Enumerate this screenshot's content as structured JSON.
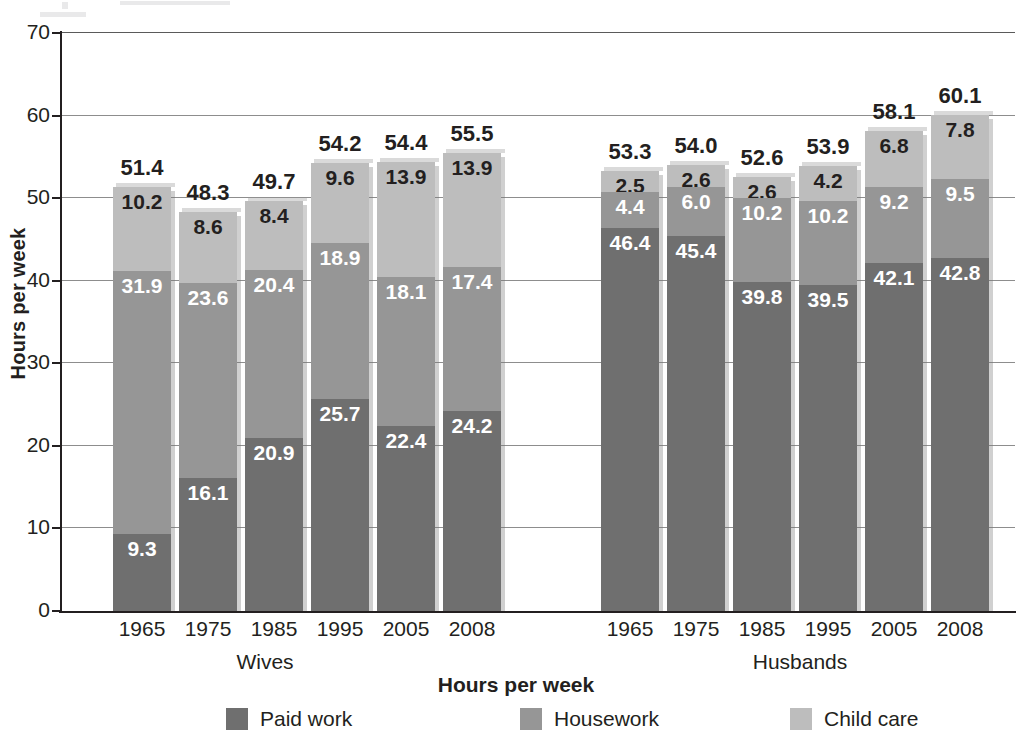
{
  "axis": {
    "y_label": "Hours per week",
    "y_ticks": [
      "70",
      "60",
      "50",
      "40",
      "30",
      "20",
      "10",
      "0"
    ],
    "y_min": 0,
    "y_max": 70
  },
  "groups": [
    {
      "name": "Wives",
      "label": "Wives"
    },
    {
      "name": "Husbands",
      "label": "Husbands"
    }
  ],
  "legend": {
    "title": "Hours per week",
    "items": [
      {
        "label": "Paid work",
        "color": "#6f6f6f",
        "swatch": "paid-work-swatch"
      },
      {
        "label": "Housework",
        "color": "#969696",
        "swatch": "housework-swatch"
      },
      {
        "label": "Child care",
        "color": "#bdbdbd",
        "swatch": "child-care-swatch"
      }
    ]
  },
  "chart_data": {
    "type": "bar",
    "subtype": "stacked",
    "title": "",
    "xlabel": "",
    "ylabel": "Hours per week",
    "ylim": [
      0,
      70
    ],
    "ytick_step": 10,
    "grid": true,
    "legend_position": "bottom",
    "categories": [
      "1965",
      "1975",
      "1985",
      "1995",
      "2005",
      "2008"
    ],
    "groups": [
      "Wives",
      "Husbands"
    ],
    "series": [
      {
        "name": "Paid work",
        "color": "#6f6f6f",
        "values": {
          "Wives": [
            9.3,
            16.1,
            20.9,
            25.7,
            22.4,
            24.2
          ],
          "Husbands": [
            46.4,
            45.4,
            39.8,
            39.5,
            42.1,
            42.8
          ]
        }
      },
      {
        "name": "Housework",
        "color": "#969696",
        "values": {
          "Wives": [
            31.9,
            23.6,
            20.4,
            18.9,
            18.1,
            17.4
          ],
          "Husbands": [
            4.4,
            6.0,
            10.2,
            10.2,
            9.2,
            9.5
          ]
        }
      },
      {
        "name": "Child care",
        "color": "#bdbdbd",
        "values": {
          "Wives": [
            10.2,
            8.6,
            8.4,
            9.6,
            13.9,
            13.9
          ],
          "Husbands": [
            2.5,
            2.6,
            2.6,
            4.2,
            6.8,
            7.8
          ]
        }
      }
    ],
    "totals": {
      "Wives": [
        51.4,
        48.3,
        49.7,
        54.2,
        54.4,
        55.5
      ],
      "Husbands": [
        53.3,
        54.0,
        52.6,
        53.9,
        58.1,
        60.1
      ]
    }
  },
  "bars": {
    "wives": [
      {
        "year": "1965",
        "total": "51.4",
        "paid": "9.3",
        "house": "31.9",
        "child": "10.2"
      },
      {
        "year": "1975",
        "total": "48.3",
        "paid": "16.1",
        "house": "23.6",
        "child": "8.6"
      },
      {
        "year": "1985",
        "total": "49.7",
        "paid": "20.9",
        "house": "20.4",
        "child": "8.4"
      },
      {
        "year": "1995",
        "total": "54.2",
        "paid": "25.7",
        "house": "18.9",
        "child": "9.6"
      },
      {
        "year": "2005",
        "total": "54.4",
        "paid": "22.4",
        "house": "18.1",
        "child": "13.9"
      },
      {
        "year": "2008",
        "total": "55.5",
        "paid": "24.2",
        "house": "17.4",
        "child": "13.9"
      }
    ],
    "husbands": [
      {
        "year": "1965",
        "total": "53.3",
        "paid": "46.4",
        "house": "4.4",
        "child": "2.5"
      },
      {
        "year": "1975",
        "total": "54.0",
        "paid": "45.4",
        "house": "6.0",
        "child": "2.6"
      },
      {
        "year": "1985",
        "total": "52.6",
        "paid": "39.8",
        "house": "10.2",
        "child": "2.6"
      },
      {
        "year": "1995",
        "total": "53.9",
        "paid": "39.5",
        "house": "10.2",
        "child": "4.2"
      },
      {
        "year": "2005",
        "total": "58.1",
        "paid": "42.1",
        "house": "9.2",
        "child": "6.8"
      },
      {
        "year": "2008",
        "total": "60.1",
        "paid": "42.8",
        "house": "9.5",
        "child": "7.8"
      }
    ]
  }
}
